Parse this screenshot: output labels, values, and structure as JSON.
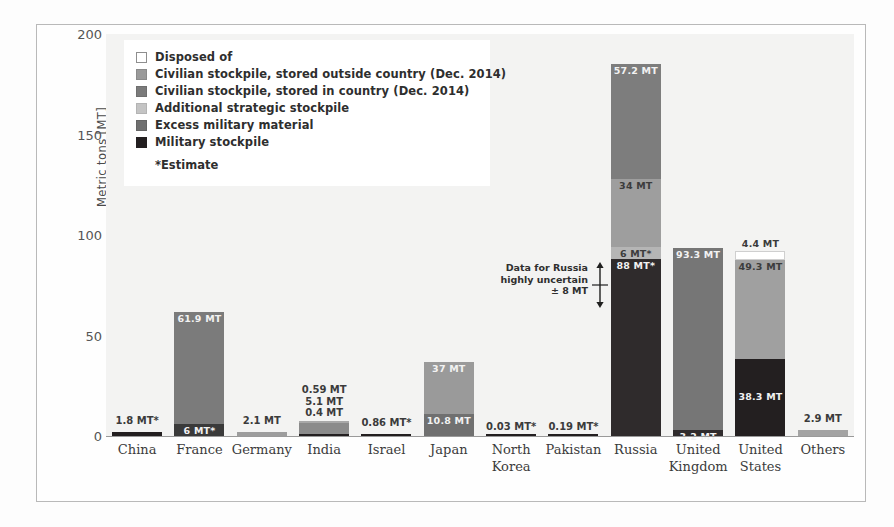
{
  "chart_data": {
    "type": "bar",
    "stacked": true,
    "title": "",
    "xlabel": "",
    "ylabel": "Metric tons [MT]",
    "ylim": [
      0,
      200
    ],
    "yticks": [
      0,
      50,
      100,
      150,
      200
    ],
    "grid": false,
    "legend_position": "top-left inside plot",
    "categories": [
      "China",
      "France",
      "Germany",
      "India",
      "Israel",
      "Japan",
      "North Korea",
      "Pakistan",
      "Russia",
      "United Kingdom",
      "United States",
      "Others"
    ],
    "series": [
      {
        "name": "Military stockpile",
        "color": "#231f20",
        "values": [
          1.8,
          6,
          0,
          0.4,
          0.86,
          0,
          0.03,
          0.19,
          88,
          3.2,
          38.3,
          0
        ]
      },
      {
        "name": "Excess military material",
        "color": "#6f6f6f",
        "values": [
          0,
          0,
          0,
          0,
          0,
          0,
          0,
          0,
          6,
          0,
          0,
          0
        ]
      },
      {
        "name": "Additional strategic stockpile",
        "color": "#b9b9b9",
        "values": [
          0,
          0,
          0,
          0,
          0,
          0,
          0,
          0,
          34,
          0,
          49.3,
          0
        ]
      },
      {
        "name": "Civilian stockpile, stored in country (Dec. 2014)",
        "color": "#7b7b7b",
        "values": [
          0,
          61.9,
          2.1,
          5.1,
          0,
          10.8,
          0,
          0,
          0,
          0,
          0,
          2.9
        ]
      },
      {
        "name": "Civilian stockpile, stored outside country (Dec. 2014)",
        "color": "#9a9a9a",
        "values": [
          0,
          0,
          0,
          0.59,
          0,
          37,
          0,
          0,
          57.2,
          93.3,
          0,
          0
        ]
      },
      {
        "name": "Disposed of",
        "color": "#ffffff",
        "values": [
          0,
          0,
          0,
          0,
          0,
          0,
          0,
          0,
          0,
          0,
          4.4,
          0
        ]
      }
    ],
    "annotations": [
      {
        "text": "Data for Russia highly uncertain ± 8 MT",
        "target": "Russia"
      },
      {
        "text": "*Estimate",
        "target": "legend"
      }
    ]
  },
  "legend": {
    "items": [
      {
        "label": "Disposed of",
        "color": "#ffffff",
        "border": "#8e8e8e"
      },
      {
        "label": "Civilian stockpile, stored outside country (Dec. 2014)",
        "color": "#9a9a9a",
        "border": "#8a8a8a"
      },
      {
        "label": "Civilian stockpile, stored in country (Dec. 2014)",
        "color": "#7b7b7b",
        "border": "#6f6f6f"
      },
      {
        "label": "Additional strategic stockpile",
        "color": "#c4c4c4",
        "border": "#b4b4b4"
      },
      {
        "label": "Excess military material",
        "color": "#6f6f6f",
        "border": "#646464"
      },
      {
        "label": "Military stockpile",
        "color": "#231f20",
        "border": "#231f20"
      }
    ],
    "note": "*Estimate"
  },
  "axes": {
    "y_title": "Metric tons [MT]",
    "y_ticks": [
      "200",
      "150",
      "100",
      "50",
      "0"
    ]
  },
  "annotation": {
    "line1": "Data for Russia",
    "line2": "highly uncertain",
    "line3": "± 8 MT"
  },
  "bars": [
    {
      "country": "China",
      "x_label_line1": "China",
      "x_label_line2": "",
      "segments": [
        {
          "name": "Military stockpile",
          "value": 1.8,
          "color": "#231f20",
          "label": "",
          "label_pos": "none",
          "label_tone": "onDark"
        }
      ],
      "above_label": "1.8 MT*",
      "above_label_offset": 6
    },
    {
      "country": "France",
      "x_label_line1": "France",
      "x_label_line2": "",
      "segments": [
        {
          "name": "Military stockpile",
          "value": 6,
          "color": "#3a3a3a",
          "label": "6 MT*",
          "label_pos": "in",
          "label_tone": "onDark"
        },
        {
          "name": "Civilian stockpile, stored in country (Dec. 2014)",
          "value": 55.9,
          "color": "#7b7b7b",
          "label": "61.9 MT",
          "label_pos": "in",
          "label_tone": "onDark"
        }
      ],
      "above_label": "",
      "above_label_offset": 0
    },
    {
      "country": "Germany",
      "x_label_line1": "Germany",
      "x_label_line2": "",
      "segments": [
        {
          "name": "Civilian stockpile, stored in country (Dec. 2014)",
          "value": 2.1,
          "color": "#9d9d9d",
          "label": "",
          "label_pos": "none",
          "label_tone": "onLight"
        }
      ],
      "above_label": "2.1 MT",
      "above_label_offset": 6
    },
    {
      "country": "India",
      "x_label_line1": "India",
      "x_label_line2": "",
      "segments": [
        {
          "name": "Military stockpile",
          "value": 0.4,
          "color": "#231f20",
          "label": "",
          "label_pos": "none",
          "label_tone": "onDark"
        },
        {
          "name": "Civilian stockpile, stored in country (Dec. 2014)",
          "value": 5.1,
          "color": "#8b8b8b",
          "label": "",
          "label_pos": "none",
          "label_tone": "onLight"
        },
        {
          "name": "Civilian stockpile, stored outside country (Dec. 2014)",
          "value": 0.59,
          "color": "#a8a8a8",
          "label": "",
          "label_pos": "none",
          "label_tone": "onLight"
        }
      ],
      "stacked_labels": [
        "0.59 MT",
        "5.1 MT",
        "0.4 MT"
      ],
      "above_label": "",
      "above_label_offset": 0
    },
    {
      "country": "Israel",
      "x_label_line1": "Israel",
      "x_label_line2": "",
      "segments": [
        {
          "name": "Military stockpile",
          "value": 0.86,
          "color": "#231f20",
          "label": "",
          "label_pos": "none",
          "label_tone": "onDark"
        }
      ],
      "above_label": "0.86 MT*",
      "above_label_offset": 6
    },
    {
      "country": "Japan",
      "x_label_line1": "Japan",
      "x_label_line2": "",
      "segments": [
        {
          "name": "Civilian stockpile, stored in country (Dec. 2014)",
          "value": 10.8,
          "color": "#707070",
          "label": "10.8 MT",
          "label_pos": "in",
          "label_tone": "onDark"
        },
        {
          "name": "Civilian stockpile, stored outside country (Dec. 2014)",
          "value": 26.2,
          "color": "#9a9a9a",
          "label": "37 MT",
          "label_pos": "in",
          "label_tone": "onDark"
        }
      ],
      "above_label": "",
      "above_label_offset": 0
    },
    {
      "country": "North Korea",
      "x_label_line1": "North",
      "x_label_line2": "Korea",
      "segments": [
        {
          "name": "Military stockpile",
          "value": 0.03,
          "color": "#231f20",
          "label": "",
          "label_pos": "none",
          "label_tone": "onDark"
        }
      ],
      "above_label": "0.03 MT*",
      "above_label_offset": 4
    },
    {
      "country": "Pakistan",
      "x_label_line1": "Pakistan",
      "x_label_line2": "",
      "segments": [
        {
          "name": "Military stockpile",
          "value": 0.19,
          "color": "#231f20",
          "label": "",
          "label_pos": "none",
          "label_tone": "onDark"
        }
      ],
      "above_label": "0.19 MT*",
      "above_label_offset": 4
    },
    {
      "country": "Russia",
      "x_label_line1": "Russia",
      "x_label_line2": "",
      "segments": [
        {
          "name": "Military stockpile",
          "value": 88,
          "color": "#2f2b2c",
          "label": "88 MT*",
          "label_pos": "in",
          "label_tone": "onDark"
        },
        {
          "name": "Excess military material",
          "value": 6,
          "color": "#b5b5b5",
          "label": "6 MT*",
          "label_pos": "in",
          "label_tone": "onLight"
        },
        {
          "name": "Additional strategic stockpile",
          "value": 34,
          "color": "#9e9e9e",
          "label": "34 MT",
          "label_pos": "in",
          "label_tone": "onLight"
        },
        {
          "name": "Civilian stockpile, stored outside country (Dec. 2014)",
          "value": 57.2,
          "color": "#7d7d7d",
          "label": "57.2 MT",
          "label_pos": "in",
          "label_tone": "onDark"
        }
      ],
      "above_label": "",
      "above_label_offset": 0
    },
    {
      "country": "United Kingdom",
      "x_label_line1": "United",
      "x_label_line2": "Kingdom",
      "segments": [
        {
          "name": "Military stockpile",
          "value": 3.2,
          "color": "#2f2b2c",
          "label": "3.2 MT",
          "label_pos": "in",
          "label_tone": "onDark"
        },
        {
          "name": "Civilian stockpile, stored outside country (Dec. 2014)",
          "value": 90.1,
          "color": "#767676",
          "label": "93.3 MT",
          "label_pos": "in",
          "label_tone": "onDark"
        }
      ],
      "above_label": "",
      "above_label_offset": 0
    },
    {
      "country": "United States",
      "x_label_line1": "United",
      "x_label_line2": "States",
      "segments": [
        {
          "name": "Military stockpile",
          "value": 38.3,
          "color": "#231f20",
          "label": "38.3 MT",
          "label_pos": "in-mid",
          "label_tone": "onDark"
        },
        {
          "name": "Additional strategic stockpile",
          "value": 49.3,
          "color": "#a0a0a0",
          "label": "49.3 MT",
          "label_pos": "in",
          "label_tone": "onLight"
        },
        {
          "name": "Disposed of",
          "value": 4.4,
          "color": "#ffffff",
          "label": "4.4 MT",
          "label_pos": "above",
          "label_tone": "onLight"
        }
      ],
      "above_label": "",
      "above_label_offset": 0
    },
    {
      "country": "Others",
      "x_label_line1": "Others",
      "x_label_line2": "",
      "segments": [
        {
          "name": "Civilian stockpile, stored in country (Dec. 2014)",
          "value": 2.9,
          "color": "#a3a3a3",
          "label": "",
          "label_pos": "none",
          "label_tone": "onLight"
        }
      ],
      "above_label": "2.9 MT",
      "above_label_offset": 6
    }
  ]
}
